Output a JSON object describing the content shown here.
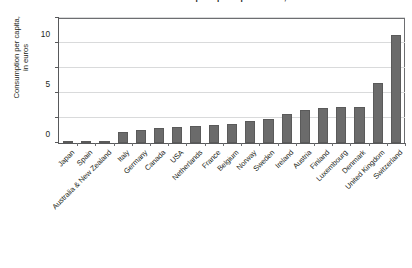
{
  "chart_data": {
    "type": "bar",
    "title": "Annual fair-trade consumption per capita in 2007, in euros",
    "xlabel": "",
    "ylabel": "Consumption per capita,\nin euros",
    "ylim": [
      0,
      25
    ],
    "yticks": [
      0,
      5,
      10,
      15,
      20,
      25
    ],
    "ytick_labels": [
      "0",
      "5",
      "10",
      "15",
      "20",
      "25"
    ],
    "grid": true,
    "legend": "none",
    "bar_color": "#6b6b6b",
    "axis_color": "#58595b",
    "grid_color": "#d9dadb",
    "categories": [
      "Japan",
      "Spain",
      "Australia & New Zealand",
      "Italy",
      "Germany",
      "Canada",
      "USA",
      "Netherlands",
      "France",
      "Belgium",
      "Norway",
      "Sweden",
      "Ireland",
      "Austria",
      "Finland",
      "Luxembourg",
      "Denmark",
      "United Kingdom",
      "Switzerland"
    ],
    "values": [
      0.1,
      0.2,
      0.3,
      2.3,
      2.7,
      3.0,
      3.2,
      3.4,
      3.6,
      3.9,
      4.4,
      4.9,
      5.8,
      6.7,
      7.1,
      7.2,
      7.3,
      12.1,
      21.7
    ]
  }
}
